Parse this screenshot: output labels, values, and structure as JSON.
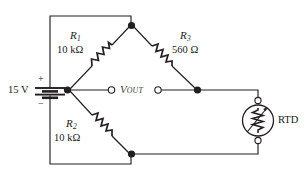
{
  "figure": {
    "type": "circuit-schematic"
  },
  "source": {
    "name": "battery-dc-source",
    "voltage_label": "15 V",
    "plus_sign": "+",
    "minus_sign": "−"
  },
  "components": [
    {
      "id": "R1",
      "ref_letter": "R",
      "ref_subscript": "1",
      "value_label": "10 kΩ",
      "symbol": "resistor-zigzag",
      "branch": "upper-left"
    },
    {
      "id": "R2",
      "ref_letter": "R",
      "ref_subscript": "2",
      "value_label": "10 kΩ",
      "symbol": "resistor-zigzag",
      "branch": "lower-left"
    },
    {
      "id": "R3",
      "ref_letter": "R",
      "ref_subscript": "3",
      "value_label": "560 Ω",
      "symbol": "resistor-zigzag",
      "branch": "upper-right"
    },
    {
      "id": "RTD",
      "ref_letter": "RTD",
      "value_label": "RTD",
      "symbol": "variable-resistor-in-circle",
      "branch": "lower-right"
    }
  ],
  "output": {
    "label_v": "V",
    "label_sub": "OUT",
    "terminal_left": "open-terminal",
    "terminal_right": "open-terminal"
  },
  "labels": {
    "r1_value": "10 kΩ",
    "r2_value": "10 kΩ",
    "r3_value": "560 Ω",
    "rtd_name": "RTD",
    "source_value": "15 V"
  },
  "colors": {
    "ink": "#231f20",
    "background": "#ffffff",
    "vout_text": "#3c3c3c"
  }
}
